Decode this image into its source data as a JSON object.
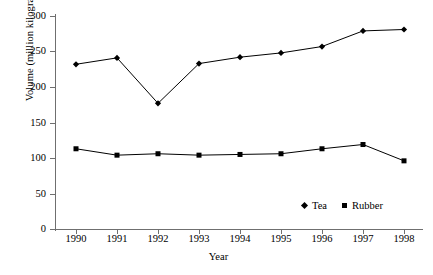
{
  "chart_data": {
    "type": "line",
    "title": "",
    "xlabel": "Year",
    "ylabel": "Volume (million kilograms)",
    "categories": [
      "1990",
      "1991",
      "1992",
      "1993",
      "1994",
      "1995",
      "1996",
      "1997",
      "1998"
    ],
    "x": [
      1990,
      1991,
      1992,
      1993,
      1994,
      1995,
      1996,
      1997,
      1998
    ],
    "series": [
      {
        "name": "Tea",
        "marker": "diamond",
        "color": "#000000",
        "values": [
          232,
          241,
          177,
          233,
          242,
          248,
          257,
          279,
          281
        ]
      },
      {
        "name": "Rubber",
        "marker": "square",
        "color": "#000000",
        "values": [
          113,
          104,
          106,
          104,
          105,
          106,
          113,
          119,
          96
        ]
      }
    ],
    "ylim": [
      0,
      300
    ],
    "yticks": [
      0,
      50,
      100,
      150,
      200,
      250,
      300
    ],
    "ytick_labels": [
      "0",
      "50",
      "100",
      "150",
      "200",
      "250",
      "300"
    ],
    "xtick_labels": [
      "1990",
      "1991",
      "1992",
      "1993",
      "1994",
      "1995",
      "1996",
      "1997",
      "1998"
    ],
    "grid": false,
    "legend_position": "inside-bottom-right",
    "legend_entries": [
      "Tea",
      "Rubber"
    ]
  },
  "axes": {
    "y_title": "Volume (million kilograms)",
    "x_title": "Year"
  }
}
